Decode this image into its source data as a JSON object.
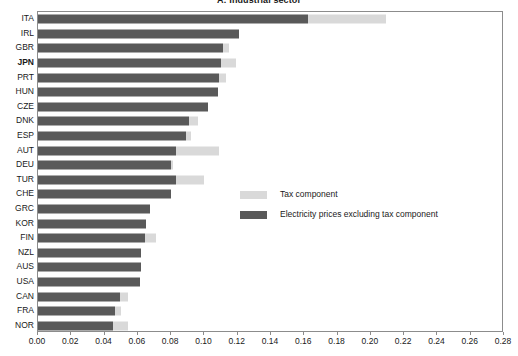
{
  "chart_data": {
    "type": "bar",
    "orientation": "horizontal",
    "stacked": true,
    "title": "A: Industrial sector",
    "xlabel": "",
    "ylabel": "",
    "xlim": [
      0.0,
      0.28
    ],
    "xticks": [
      "0.00",
      "0.02",
      "0.04",
      "0.06",
      "0.08",
      "0.10",
      "0.12",
      "0.14",
      "0.16",
      "0.18",
      "0.20",
      "0.22",
      "0.24",
      "0.26",
      "0.28"
    ],
    "xtick_values": [
      0.0,
      0.02,
      0.04,
      0.06,
      0.08,
      0.1,
      0.12,
      0.14,
      0.16,
      0.18,
      0.2,
      0.22,
      0.24,
      0.26,
      0.28
    ],
    "grid": false,
    "legend_position": "center-right",
    "highlighted_category": "JPN",
    "categories": [
      "ITA",
      "IRL",
      "GBR",
      "JPN",
      "PRT",
      "HUN",
      "CZE",
      "DNK",
      "ESP",
      "AUT",
      "DEU",
      "TUR",
      "CHE",
      "GRC",
      "KOR",
      "FIN",
      "NZL",
      "AUS",
      "USA",
      "CAN",
      "FRA",
      "NOR"
    ],
    "series": [
      {
        "name": "Electricity prices excluding tax component",
        "color": "#595959",
        "values": [
          0.162,
          0.121,
          0.111,
          0.11,
          0.109,
          0.108,
          0.102,
          0.091,
          0.089,
          0.083,
          0.08,
          0.083,
          0.08,
          0.067,
          0.065,
          0.064,
          0.062,
          0.062,
          0.061,
          0.049,
          0.046,
          0.045
        ]
      },
      {
        "name": "Tax component",
        "color": "#d9d9d9",
        "values": [
          0.047,
          0.0,
          0.004,
          0.009,
          0.004,
          0.0,
          0.0,
          0.005,
          0.003,
          0.026,
          0.001,
          0.017,
          0.0,
          0.0,
          0.0,
          0.007,
          0.0,
          0.0,
          0.0,
          0.005,
          0.004,
          0.009
        ]
      }
    ],
    "totals": [
      0.209,
      0.121,
      0.115,
      0.119,
      0.113,
      0.108,
      0.102,
      0.096,
      0.092,
      0.109,
      0.081,
      0.1,
      0.08,
      0.067,
      0.065,
      0.071,
      0.062,
      0.062,
      0.061,
      0.054,
      0.05,
      0.054
    ]
  },
  "legend": {
    "items": [
      {
        "label": "Tax component",
        "swatch": "light"
      },
      {
        "label": "Electricity prices excluding tax component",
        "swatch": "dark"
      }
    ]
  }
}
